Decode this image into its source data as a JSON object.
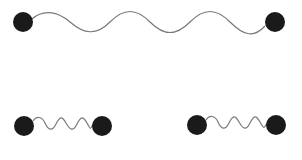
{
  "diagram": {
    "colors": {
      "background": "#ffffff",
      "mass": "#1a1a1a",
      "spring": "#7a7a7a"
    },
    "systems": [
      {
        "id": "long-spring",
        "masses": [
          {
            "cx": 23,
            "cy": 22,
            "r": 10
          },
          {
            "cx": 275,
            "cy": 22,
            "r": 10
          }
        ],
        "spring_path": "M 32 19 C 42 10, 56 10, 70 22 S 96 36, 110 22 S 136 8, 150 22 S 176 36, 190 22 S 216 8, 230 22 S 254 38, 265 26"
      },
      {
        "id": "short-spring-left",
        "masses": [
          {
            "cx": 24,
            "cy": 126,
            "r": 10
          },
          {
            "cx": 102,
            "cy": 126,
            "r": 10
          }
        ],
        "spring_path": "M 33 121 C 36 116, 42 116, 45 123 S 52 132, 56 124 S 62 116, 66 123 S 73 132, 77 124 S 83 116, 87 123 S 90 130, 93 124"
      },
      {
        "id": "short-spring-right",
        "masses": [
          {
            "cx": 197,
            "cy": 125,
            "r": 10
          },
          {
            "cx": 276,
            "cy": 125,
            "r": 10
          }
        ],
        "spring_path": "M 206 120 C 209 115, 215 115, 218 122 S 225 131, 229 123 S 235 115, 239 122 S 246 131, 250 123 S 256 115, 260 122 S 264 129, 267 123"
      }
    ]
  }
}
